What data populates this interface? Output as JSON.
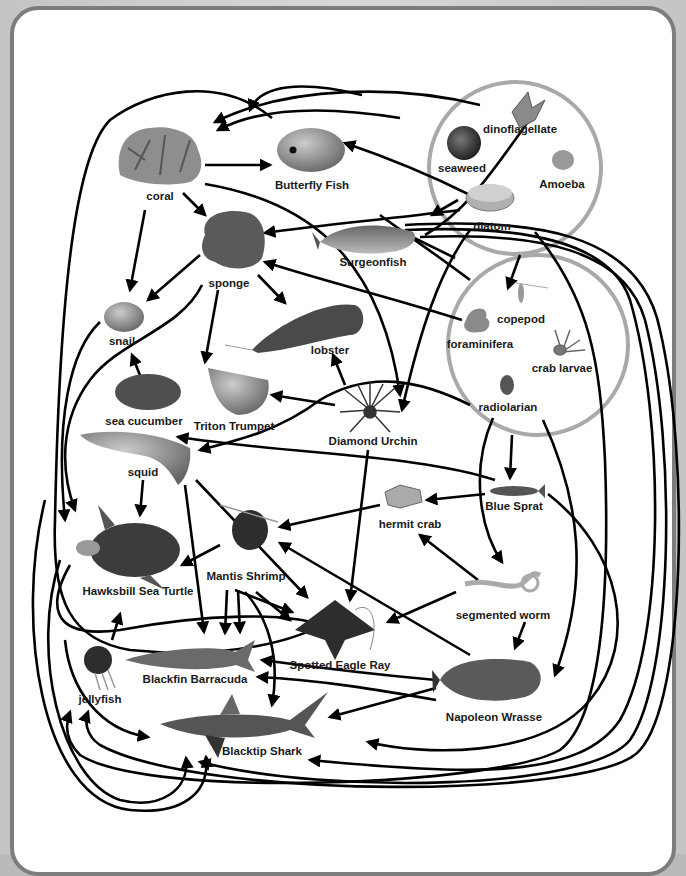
{
  "diagram": {
    "type": "food web",
    "groups": [
      {
        "id": "producers",
        "members": [
          "dinoflagellate",
          "seaweed",
          "Amoeba",
          "diatom"
        ]
      },
      {
        "id": "zooplankton",
        "members": [
          "copepod",
          "foraminifera",
          "crab larvae",
          "radiolarian"
        ]
      }
    ],
    "nodes": {
      "dinoflagellate": "dinoflagellate",
      "seaweed": "seaweed",
      "amoeba": "Amoeba",
      "diatom": "diatom",
      "copepod": "copepod",
      "foraminifera": "foraminifera",
      "crab_larvae": "crab larvae",
      "radiolarian": "radiolarian",
      "coral": "coral",
      "butterfly_fish": "Butterfly Fish",
      "sponge": "sponge",
      "surgeonfish": "Surgeonfish",
      "snail": "snail",
      "lobster": "lobster",
      "sea_cucumber": "sea cucumber",
      "triton_trumpet": "Triton Trumpet",
      "diamond_urchin": "Diamond Urchin",
      "squid": "squid",
      "blue_sprat": "Blue Sprat",
      "hermit_crab": "hermit crab",
      "hawksbill_sea_turtle": "Hawksbill Sea Turtle",
      "mantis_shrimp": "Mantis Shrimp",
      "segmented_worm": "segmented worm",
      "spotted_eagle_ray": "Spotted Eagle Ray",
      "jellyfish": "jellyfish",
      "blackfin_barracuda": "Blackfin Barracuda",
      "napoleon_wrasse": "Napoleon Wrasse",
      "blacktip_shark": "Blacktip Shark"
    },
    "edges": [
      {
        "from": "coral",
        "to": "Butterfly Fish"
      },
      {
        "from": "coral",
        "to": "sponge"
      },
      {
        "from": "coral",
        "to": "snail"
      },
      {
        "from": "coral",
        "to": "Diamond Urchin"
      },
      {
        "from": "producers",
        "to": "coral"
      },
      {
        "from": "Butterfly Fish",
        "to": "coral"
      },
      {
        "from": "producers",
        "to": "Butterfly Fish"
      },
      {
        "from": "diatom",
        "to": "sponge"
      },
      {
        "from": "foraminifera",
        "to": "sponge"
      },
      {
        "from": "diatom",
        "to": "Surgeonfish"
      },
      {
        "from": "producers",
        "to": "copepod"
      },
      {
        "from": "sponge",
        "to": "snail"
      },
      {
        "from": "sponge",
        "to": "lobster"
      },
      {
        "from": "sponge",
        "to": "Triton Trumpet"
      },
      {
        "from": "sea cucumber",
        "to": "snail"
      },
      {
        "from": "Diamond Urchin",
        "to": "Triton Trumpet"
      },
      {
        "from": "Diamond Urchin",
        "to": "lobster"
      },
      {
        "from": "Diamond Urchin",
        "to": "Spotted Eagle Ray"
      },
      {
        "from": "radiolarian",
        "to": "squid"
      },
      {
        "from": "Blue Sprat",
        "to": "squid"
      },
      {
        "from": "radiolarian",
        "to": "Blue Sprat"
      },
      {
        "from": "radiolarian",
        "to": "segmented worm"
      },
      {
        "from": "radiolarian",
        "to": "Napoleon Wrasse"
      },
      {
        "from": "Blue Sprat",
        "to": "hermit crab"
      },
      {
        "from": "hermit crab",
        "to": "Mantis Shrimp"
      },
      {
        "from": "segmented worm",
        "to": "hermit crab"
      },
      {
        "from": "segmented worm",
        "to": "Spotted Eagle Ray"
      },
      {
        "from": "segmented worm",
        "to": "Napoleon Wrasse"
      },
      {
        "from": "squid",
        "to": "Hawksbill Sea Turtle"
      },
      {
        "from": "squid",
        "to": "Blackfin Barracuda"
      },
      {
        "from": "squid",
        "to": "Spotted Eagle Ray"
      },
      {
        "from": "Mantis Shrimp",
        "to": "Hawksbill Sea Turtle"
      },
      {
        "from": "Mantis Shrimp",
        "to": "Blackfin Barracuda"
      },
      {
        "from": "Mantis Shrimp",
        "to": "Spotted Eagle Ray"
      },
      {
        "from": "Mantis Shrimp",
        "to": "Blacktip Shark"
      },
      {
        "from": "Napoleon Wrasse",
        "to": "Mantis Shrimp"
      },
      {
        "from": "Napoleon Wrasse",
        "to": "Blackfin Barracuda"
      },
      {
        "from": "Napoleon Wrasse",
        "to": "Blacktip Shark"
      },
      {
        "from": "Blue Sprat",
        "to": "Blacktip Shark"
      },
      {
        "from": "jellyfish",
        "to": "Hawksbill Sea Turtle"
      },
      {
        "from": "jellyfish",
        "to": "Blacktip Shark"
      },
      {
        "from": "snail",
        "to": "Hawksbill Sea Turtle"
      },
      {
        "from": "sponge",
        "to": "Hawksbill Sea Turtle"
      },
      {
        "from": "Surgeonfish",
        "to": "Blacktip Shark"
      },
      {
        "from": "Surgeonfish",
        "to": "jellyfish"
      },
      {
        "from": "Hawksbill Sea Turtle",
        "to": "Blacktip Shark"
      },
      {
        "from": "Blackfin Barracuda",
        "to": "Blacktip Shark"
      }
    ]
  },
  "colors": {
    "frame": "#c4c4c4",
    "panel_border": "#7d7d7d",
    "ring": "#a9a9a9",
    "arrow": "#000000",
    "label": "#1a1a1a"
  }
}
